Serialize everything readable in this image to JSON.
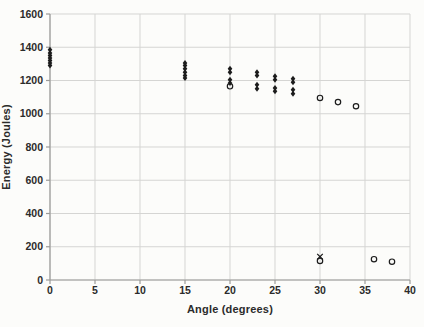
{
  "chart_data": {
    "type": "scatter",
    "title": "",
    "xlabel": "Angle (degrees)",
    "ylabel": "Energy (Joules)",
    "xlim": [
      0,
      40
    ],
    "ylim": [
      0,
      1600
    ],
    "x_ticks": [
      0,
      5,
      10,
      15,
      20,
      25,
      30,
      35,
      40
    ],
    "y_ticks": [
      0,
      200,
      400,
      600,
      800,
      1000,
      1200,
      1400,
      1600
    ],
    "grid": true,
    "legend_position": "none",
    "colors": {
      "marker": "#1c1c1c",
      "grid": "#d5d5d3",
      "axis": "#9b9b99",
      "tick_text": "#2b2b2b",
      "background": "#fcfcfa"
    },
    "series": [
      {
        "name": "filled-diamond-trials",
        "marker": "diamond",
        "points": [
          [
            0,
            1385
          ],
          [
            0,
            1365
          ],
          [
            0,
            1350
          ],
          [
            0,
            1335
          ],
          [
            0,
            1320
          ],
          [
            0,
            1305
          ],
          [
            0,
            1290
          ],
          [
            15,
            1305
          ],
          [
            15,
            1290
          ],
          [
            15,
            1270
          ],
          [
            15,
            1250
          ],
          [
            15,
            1230
          ],
          [
            15,
            1215
          ],
          [
            20,
            1270
          ],
          [
            20,
            1250
          ],
          [
            20,
            1205
          ],
          [
            20,
            1185
          ],
          [
            23,
            1250
          ],
          [
            23,
            1230
          ],
          [
            23,
            1175
          ],
          [
            23,
            1150
          ],
          [
            25,
            1225
          ],
          [
            25,
            1205
          ],
          [
            25,
            1155
          ],
          [
            25,
            1135
          ],
          [
            27,
            1210
          ],
          [
            27,
            1190
          ],
          [
            27,
            1145
          ],
          [
            27,
            1120
          ]
        ]
      },
      {
        "name": "open-circle-trials",
        "marker": "circle-open",
        "points": [
          [
            20,
            1165
          ],
          [
            30,
            1095
          ],
          [
            32,
            1070
          ],
          [
            34,
            1045
          ],
          [
            30,
            115
          ],
          [
            36,
            125
          ],
          [
            38,
            110
          ]
        ]
      },
      {
        "name": "x-marker-trials",
        "marker": "x",
        "points": [
          [
            30,
            140
          ]
        ]
      }
    ]
  }
}
